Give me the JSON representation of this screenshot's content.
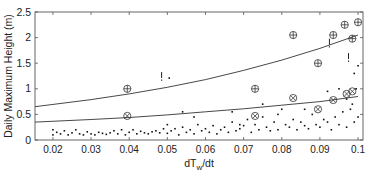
{
  "chart_data": {
    "type": "scatter",
    "title": "",
    "xlabel": "dT",
    "xlabel_subscript": "w",
    "xlabel_suffix": "/dt",
    "ylabel": "Daily Maximum Height (m)",
    "xlim": [
      0.0153,
      0.1013
    ],
    "ylim": [
      0,
      2.5
    ],
    "x_ticks": [
      0.02,
      0.03,
      0.04,
      0.05,
      0.06,
      0.07,
      0.08,
      0.09,
      0.1
    ],
    "x_tick_labels": [
      "0.02",
      "0.03",
      "0.04",
      "0.05",
      "0.06",
      "0.07",
      "0.08",
      "0.09",
      "0.1"
    ],
    "y_ticks": [
      0,
      0.5,
      1,
      1.5,
      2,
      2.5
    ],
    "y_tick_labels": [
      "0",
      "0.5",
      "1",
      "1.5",
      "2",
      "2.5"
    ],
    "grid": false,
    "legend": null,
    "series": [
      {
        "name": "upper-curve",
        "kind": "line",
        "x": [
          0.0153,
          0.03,
          0.04,
          0.05,
          0.06,
          0.07,
          0.08,
          0.09,
          0.1
        ],
        "y": [
          0.65,
          0.79,
          0.9,
          1.03,
          1.18,
          1.36,
          1.56,
          1.79,
          2.05
        ]
      },
      {
        "name": "lower-curve",
        "kind": "line",
        "x": [
          0.0153,
          0.03,
          0.04,
          0.05,
          0.06,
          0.07,
          0.08,
          0.09,
          0.1
        ],
        "y": [
          0.35,
          0.4,
          0.44,
          0.49,
          0.55,
          0.61,
          0.68,
          0.75,
          0.85
        ]
      },
      {
        "name": "circle-plus-markers",
        "kind": "marker",
        "symbol": "circle-plus",
        "x": [
          0.0395,
          0.073,
          0.083,
          0.0895,
          0.0935,
          0.0965,
          0.0985,
          0.1
        ],
        "y": [
          1.0,
          1.0,
          2.05,
          1.5,
          2.05,
          2.25,
          1.98,
          2.3
        ]
      },
      {
        "name": "circle-x-markers",
        "kind": "marker",
        "symbol": "circle-x",
        "x": [
          0.0395,
          0.073,
          0.083,
          0.0895,
          0.0935,
          0.097,
          0.0985
        ],
        "y": [
          0.47,
          0.47,
          0.82,
          0.6,
          0.78,
          0.9,
          0.95
        ]
      },
      {
        "name": "exclamation-markers",
        "kind": "marker",
        "symbol": "exclamation",
        "x": [
          0.0485,
          0.0925,
          0.0975
        ],
        "y": [
          1.23,
          1.88,
          1.6
        ]
      },
      {
        "name": "daily-observations",
        "kind": "dots",
        "x": [
          0.02,
          0.02,
          0.021,
          0.022,
          0.023,
          0.024,
          0.025,
          0.026,
          0.027,
          0.028,
          0.029,
          0.03,
          0.031,
          0.032,
          0.033,
          0.034,
          0.035,
          0.036,
          0.037,
          0.038,
          0.039,
          0.04,
          0.041,
          0.042,
          0.043,
          0.044,
          0.045,
          0.046,
          0.047,
          0.048,
          0.049,
          0.05,
          0.05,
          0.051,
          0.052,
          0.053,
          0.054,
          0.055,
          0.056,
          0.057,
          0.058,
          0.059,
          0.06,
          0.061,
          0.062,
          0.063,
          0.064,
          0.065,
          0.066,
          0.067,
          0.068,
          0.069,
          0.07,
          0.071,
          0.072,
          0.073,
          0.074,
          0.075,
          0.076,
          0.077,
          0.078,
          0.079,
          0.08,
          0.081,
          0.082,
          0.083,
          0.084,
          0.085,
          0.086,
          0.087,
          0.088,
          0.089,
          0.09,
          0.091,
          0.092,
          0.093,
          0.094,
          0.095,
          0.096,
          0.097,
          0.098,
          0.099,
          0.1,
          0.0505,
          0.054,
          0.057,
          0.067,
          0.069,
          0.075,
          0.079,
          0.086,
          0.092,
          0.095,
          0.097,
          0.099,
          0.1,
          0.0995,
          0.0985
        ],
        "y": [
          0.1,
          0.2,
          0.15,
          0.12,
          0.18,
          0.1,
          0.14,
          0.2,
          0.12,
          0.1,
          0.16,
          0.12,
          0.1,
          0.15,
          0.13,
          0.11,
          0.14,
          0.18,
          0.12,
          0.2,
          0.1,
          0.15,
          0.2,
          0.12,
          0.17,
          0.14,
          0.12,
          0.16,
          0.18,
          0.14,
          0.22,
          0.3,
          0.13,
          0.18,
          0.22,
          0.1,
          0.25,
          0.15,
          0.2,
          0.12,
          0.3,
          0.18,
          0.22,
          0.15,
          0.28,
          0.12,
          0.2,
          0.25,
          0.15,
          0.35,
          0.18,
          0.22,
          0.28,
          0.4,
          0.15,
          0.3,
          0.2,
          0.45,
          0.25,
          0.18,
          0.35,
          0.2,
          0.6,
          0.3,
          0.25,
          0.4,
          0.2,
          0.35,
          0.28,
          0.22,
          0.5,
          0.3,
          0.25,
          0.4,
          0.35,
          0.2,
          0.45,
          0.3,
          0.55,
          0.25,
          0.6,
          0.35,
          0.45,
          1.21,
          0.55,
          0.45,
          0.55,
          0.3,
          0.7,
          0.5,
          0.6,
          0.95,
          1.0,
          0.8,
          1.3,
          1.45,
          1.0,
          0.7
        ]
      }
    ]
  }
}
